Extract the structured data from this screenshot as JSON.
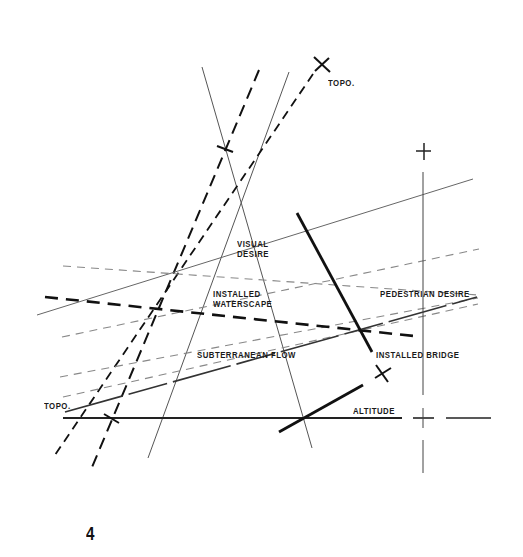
{
  "diagram": {
    "figure_number": "4",
    "labels": {
      "topo_top": "TOPO.",
      "topo_left": "TOPO.",
      "visual_desire": "VISUAL\nDESIRE",
      "installed_waterscape": "INSTALLED\nWATERSCAPE",
      "pedestrian_desire": "PEDESTRIAN DESIRE",
      "subterranean_flow": "SUBTERRANEAN FLOW",
      "installed_bridge": "INSTALLED BRIDGE",
      "altitude": "ALTITUDE"
    },
    "colors": {
      "ink": "#111111",
      "grey_line": "#777777",
      "background": "#ffffff"
    }
  }
}
